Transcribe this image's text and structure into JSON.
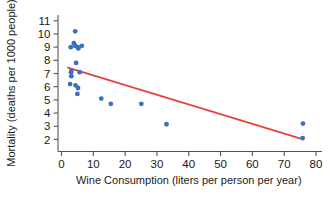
{
  "chart_data": {
    "type": "scatter",
    "title": "",
    "xlabel": "Wine Consumption (liters per person per year)",
    "ylabel": "Mortality (deaths per 1000 people)",
    "xlim": [
      0,
      80
    ],
    "ylim": [
      1.5,
      11.4
    ],
    "xticks": [
      0,
      10,
      20,
      30,
      40,
      50,
      60,
      70,
      80
    ],
    "xtick_labels": [
      "0",
      "10",
      "20",
      "30",
      "40",
      "50",
      "60",
      "70",
      "80"
    ],
    "yticks": [
      2,
      3,
      4,
      5,
      6,
      7,
      8,
      9,
      10,
      11
    ],
    "ytick_labels": [
      "2",
      "3",
      "4",
      "5",
      "6",
      "7",
      "8",
      "9",
      "10",
      "11"
    ],
    "grid": false,
    "legend": "none",
    "point_color": "#3a6fc4",
    "line_color": "#e8413d",
    "points": [
      {
        "x": 4.3,
        "y": 10.2
      },
      {
        "x": 3.9,
        "y": 9.3
      },
      {
        "x": 4.3,
        "y": 9.1
      },
      {
        "x": 2.9,
        "y": 9.0
      },
      {
        "x": 5.1,
        "y": 9.0
      },
      {
        "x": 6.4,
        "y": 9.1
      },
      {
        "x": 5.3,
        "y": 8.9
      },
      {
        "x": 4.6,
        "y": 7.8
      },
      {
        "x": 3.1,
        "y": 7.2
      },
      {
        "x": 3.0,
        "y": 7.1
      },
      {
        "x": 5.7,
        "y": 7.1
      },
      {
        "x": 3.1,
        "y": 6.8
      },
      {
        "x": 2.7,
        "y": 6.2
      },
      {
        "x": 4.4,
        "y": 6.1
      },
      {
        "x": 5.2,
        "y": 5.9
      },
      {
        "x": 5.0,
        "y": 5.45
      },
      {
        "x": 12.5,
        "y": 5.1
      },
      {
        "x": 15.5,
        "y": 4.7
      },
      {
        "x": 25.1,
        "y": 4.7
      },
      {
        "x": 33.0,
        "y": 3.15
      },
      {
        "x": 75.9,
        "y": 3.2
      },
      {
        "x": 75.8,
        "y": 2.1
      }
    ],
    "fit_line": {
      "x0": 2.0,
      "y0": 7.45,
      "x1": 76.0,
      "y1": 2.0
    }
  }
}
